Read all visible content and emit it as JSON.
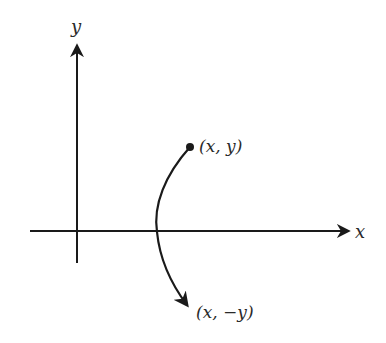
{
  "diagram": {
    "type": "coordinate-reflection",
    "axes": {
      "x_label": "x",
      "y_label": "y"
    },
    "points": [
      {
        "id": "original",
        "label": "(x, y)"
      },
      {
        "id": "reflected",
        "label": "(x, −y)"
      }
    ],
    "colors": {
      "stroke": "#1a1a1a",
      "text": "#2a2a2a",
      "background": "#ffffff"
    }
  }
}
